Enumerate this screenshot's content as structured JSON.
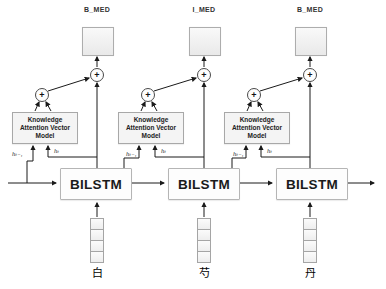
{
  "diagram": {
    "plus": "+",
    "knowledge_model": {
      "line1": "Knowledge",
      "line2": "Attention Vector",
      "line3": "Model"
    },
    "bilstm_label": "BILSTM",
    "columns": [
      {
        "tag": "B_MED",
        "char": "白",
        "h_prev": "hₜ₋₁",
        "h_cur": "hₜ"
      },
      {
        "tag": "I_MED",
        "char": "芍",
        "h_prev": "hₜ₋₁",
        "h_cur": "hₜ"
      },
      {
        "tag": "B_MED",
        "char": "丹",
        "h_prev": "hₜ₋₁",
        "h_cur": "hₜ"
      }
    ],
    "colors": {
      "line": "#1a1a1a",
      "box_border": "#a8a8a8",
      "box_fill": "#f4f4f4"
    }
  }
}
